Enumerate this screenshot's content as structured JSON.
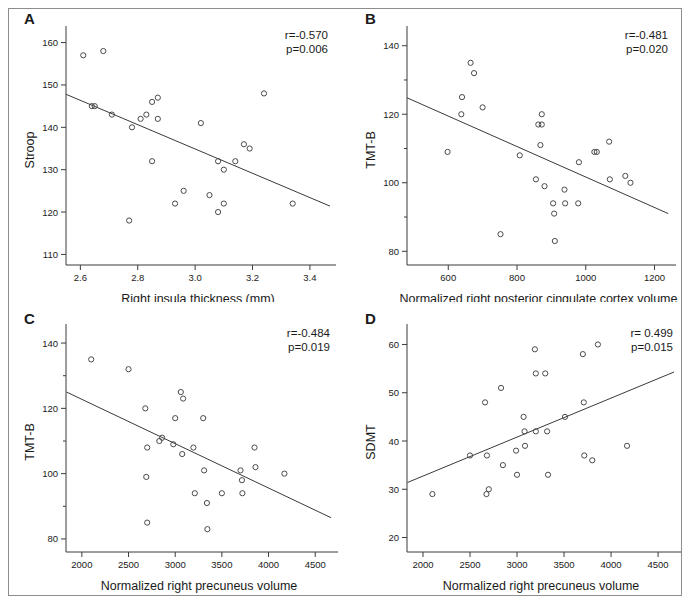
{
  "figure": {
    "background_color": "#ffffff",
    "border_color": "#8d8d8d",
    "marker_color": "#4a4a4a",
    "line_color": "#3a3a3a",
    "text_color": "#1a1a1a"
  },
  "panels": [
    {
      "letter": "A",
      "r_label": "r=-0.570",
      "p_label": "p=0.006",
      "xlabel": "Right insula thickness (mm)",
      "ylabel": "Stroop"
    },
    {
      "letter": "B",
      "r_label": "r=-0.481",
      "p_label": "p=0.020",
      "xlabel": "Normalized right posterior cingulate cortex volume",
      "ylabel": "TMT-B"
    },
    {
      "letter": "C",
      "r_label": "r=-0.484",
      "p_label": "p=0.019",
      "xlabel": "Normalized right precuneus volume",
      "ylabel": "TMT-B"
    },
    {
      "letter": "D",
      "r_label": "r= 0.499",
      "p_label": "p=0.015",
      "xlabel": "Normalized right precuneus volume",
      "ylabel": "SDMT"
    }
  ],
  "chart_data": [
    {
      "type": "scatter",
      "panel": "A",
      "title": "",
      "xlabel": "Right insula thickness (mm)",
      "ylabel": "Stroop",
      "xlim": [
        2.55,
        3.47
      ],
      "ylim": [
        107.5,
        162.5
      ],
      "xticks": [
        2.6,
        2.8,
        3.0,
        3.2,
        3.4
      ],
      "xticklabels": [
        "2.6",
        "2.8",
        "3.0",
        "3.2",
        "3.4"
      ],
      "yticks": [
        110,
        120,
        130,
        140,
        150,
        160
      ],
      "yticklabels": [
        "110",
        "120",
        "130",
        "140",
        "150",
        "160"
      ],
      "grid": false,
      "legend": "none",
      "annotations": [
        "r=-0.570",
        "p=0.006"
      ],
      "points": [
        [
          2.61,
          157
        ],
        [
          2.68,
          158
        ],
        [
          2.64,
          145
        ],
        [
          2.65,
          145
        ],
        [
          2.71,
          143
        ],
        [
          2.78,
          140
        ],
        [
          2.77,
          118
        ],
        [
          2.81,
          142
        ],
        [
          2.83,
          143
        ],
        [
          2.85,
          146
        ],
        [
          2.87,
          147
        ],
        [
          2.87,
          142
        ],
        [
          2.85,
          132
        ],
        [
          2.93,
          122
        ],
        [
          2.96,
          125
        ],
        [
          3.02,
          141
        ],
        [
          3.05,
          124
        ],
        [
          3.08,
          132
        ],
        [
          3.08,
          120
        ],
        [
          3.1,
          130
        ],
        [
          3.1,
          122
        ],
        [
          3.14,
          132
        ],
        [
          3.17,
          136
        ],
        [
          3.19,
          135
        ],
        [
          3.24,
          148
        ],
        [
          3.34,
          122
        ]
      ],
      "fit_line": {
        "x": [
          2.55,
          3.47
        ],
        "y": [
          147.8,
          121.4
        ]
      }
    },
    {
      "type": "scatter",
      "panel": "B",
      "title": "",
      "xlabel": "Normalized right posterior cingulate cortex volume",
      "ylabel": "TMT-B",
      "xlim": [
        480,
        1245
      ],
      "ylim": [
        76,
        144
      ],
      "xticks": [
        600,
        800,
        1000,
        1200
      ],
      "xticklabels": [
        "600",
        "800",
        "1000",
        "1200"
      ],
      "yticks": [
        80,
        100,
        120,
        140
      ],
      "yticklabels": [
        "80",
        "100",
        "120",
        "140"
      ],
      "grid": false,
      "legend": "none",
      "annotations": [
        "r=-0.481",
        "p=0.020"
      ],
      "points": [
        [
          598,
          109
        ],
        [
          640,
          125
        ],
        [
          638,
          120
        ],
        [
          665,
          135
        ],
        [
          675,
          132
        ],
        [
          700,
          122
        ],
        [
          752,
          85
        ],
        [
          808,
          108
        ],
        [
          855,
          101
        ],
        [
          862,
          117
        ],
        [
          872,
          117
        ],
        [
          872,
          120
        ],
        [
          868,
          111
        ],
        [
          880,
          99
        ],
        [
          905,
          94
        ],
        [
          908,
          91
        ],
        [
          910,
          83
        ],
        [
          938,
          98
        ],
        [
          940,
          94
        ],
        [
          978,
          94
        ],
        [
          980,
          106
        ],
        [
          1025,
          109
        ],
        [
          1032,
          109
        ],
        [
          1068,
          112
        ],
        [
          1070,
          101
        ],
        [
          1115,
          102
        ],
        [
          1130,
          100
        ]
      ],
      "fit_line": {
        "x": [
          480,
          1240
        ],
        "y": [
          124.8,
          91.0
        ]
      }
    },
    {
      "type": "scatter",
      "panel": "C",
      "title": "",
      "xlabel": "Normalized right precuneus volume",
      "ylabel": "TMT-B",
      "xlim": [
        1830,
        4680
      ],
      "ylim": [
        76,
        144
      ],
      "xticks": [
        2000,
        2500,
        3000,
        3500,
        4000,
        4500
      ],
      "xticklabels": [
        "2000",
        "2500",
        "3000",
        "3500",
        "4000",
        "4500"
      ],
      "yticks": [
        80,
        100,
        120,
        140
      ],
      "yticklabels": [
        "80",
        "100",
        "120",
        "140"
      ],
      "grid": false,
      "legend": "none",
      "annotations": [
        "r=-0.484",
        "p=0.019"
      ],
      "points": [
        [
          2100,
          135
        ],
        [
          2500,
          132
        ],
        [
          2680,
          120
        ],
        [
          2700,
          108
        ],
        [
          2690,
          99
        ],
        [
          2700,
          85
        ],
        [
          2830,
          110
        ],
        [
          2860,
          111
        ],
        [
          2980,
          109
        ],
        [
          3000,
          117
        ],
        [
          3060,
          125
        ],
        [
          3075,
          106
        ],
        [
          3085,
          123
        ],
        [
          3195,
          108
        ],
        [
          3210,
          94
        ],
        [
          3300,
          117
        ],
        [
          3310,
          101
        ],
        [
          3340,
          91
        ],
        [
          3345,
          83
        ],
        [
          3500,
          94
        ],
        [
          3700,
          101
        ],
        [
          3715,
          98
        ],
        [
          3720,
          94
        ],
        [
          3850,
          108
        ],
        [
          3860,
          102
        ],
        [
          4170,
          100
        ]
      ],
      "fit_line": {
        "x": [
          1835,
          4670
        ],
        "y": [
          125.0,
          86.5
        ]
      }
    },
    {
      "type": "scatter",
      "panel": "D",
      "title": "",
      "xlabel": "Normalized right precuneus volume",
      "ylabel": "SDMT",
      "xlim": [
        1830,
        4680
      ],
      "ylim": [
        17,
        63
      ],
      "xticks": [
        2000,
        2500,
        3000,
        3500,
        4000,
        4500
      ],
      "xticklabels": [
        "2000",
        "2500",
        "3000",
        "3500",
        "4000",
        "4500"
      ],
      "yticks": [
        20,
        30,
        40,
        50,
        60
      ],
      "yticklabels": [
        "20",
        "30",
        "40",
        "50",
        "60"
      ],
      "grid": false,
      "legend": "none",
      "annotations": [
        "r= 0.499",
        "p=0.015"
      ],
      "points": [
        [
          2100,
          29
        ],
        [
          2500,
          37
        ],
        [
          2660,
          48
        ],
        [
          2680,
          37
        ],
        [
          2675,
          29
        ],
        [
          2700,
          30
        ],
        [
          2830,
          51
        ],
        [
          2850,
          35
        ],
        [
          2990,
          38
        ],
        [
          3000,
          33
        ],
        [
          3070,
          45
        ],
        [
          3080,
          42
        ],
        [
          3085,
          39
        ],
        [
          3190,
          59
        ],
        [
          3200,
          42
        ],
        [
          3200,
          54
        ],
        [
          3300,
          54
        ],
        [
          3320,
          42
        ],
        [
          3330,
          33
        ],
        [
          3510,
          45
        ],
        [
          3700,
          58
        ],
        [
          3710,
          48
        ],
        [
          3715,
          37
        ],
        [
          3800,
          36
        ],
        [
          3860,
          60
        ],
        [
          4170,
          39
        ]
      ],
      "fit_line": {
        "x": [
          1835,
          4670
        ],
        "y": [
          31.4,
          54.3
        ]
      }
    }
  ]
}
